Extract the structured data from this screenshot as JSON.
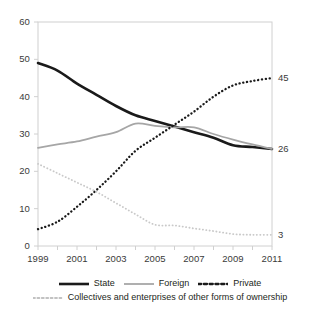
{
  "chart_data": {
    "type": "line",
    "title": "",
    "subtitle": "",
    "xlabel": "",
    "ylabel": "",
    "xlim": [
      1999,
      2011
    ],
    "ylim": [
      0,
      60
    ],
    "yticks": [
      0,
      10,
      20,
      30,
      40,
      50,
      60
    ],
    "xticks": [
      1999,
      2000,
      2001,
      2002,
      2003,
      2004,
      2005,
      2006,
      2007,
      2008,
      2009,
      2010,
      2011
    ],
    "xtick_labels": [
      "1999",
      "",
      "2001",
      "",
      "2003",
      "",
      "2005",
      "",
      "2007",
      "",
      "2009",
      "",
      "2011"
    ],
    "ytick_labels": [
      "0",
      "10",
      "20",
      "30",
      "40",
      "50",
      "60"
    ],
    "grid": false,
    "legend_position": "bottom",
    "x": [
      1999,
      2000,
      2001,
      2002,
      2003,
      2004,
      2005,
      2006,
      2007,
      2008,
      2009,
      2010,
      2011
    ],
    "series": [
      {
        "name": "State",
        "color": "#1a1a1a",
        "style": "solid",
        "width": 2.6,
        "values": [
          49,
          47,
          43.5,
          40.5,
          37.5,
          35,
          33.5,
          32,
          30.5,
          29,
          27,
          26.5,
          26
        ],
        "end_label": "26"
      },
      {
        "name": "Foreign",
        "color": "#a6a6a6",
        "style": "solid",
        "width": 1.8,
        "values": [
          26.3,
          27.2,
          28,
          29.3,
          30.5,
          32.8,
          32.2,
          31.8,
          31.8,
          30,
          28.5,
          27.2,
          26
        ],
        "end_label": ""
      },
      {
        "name": "Private",
        "color": "#1a1a1a",
        "style": "dashed",
        "width": 2.3,
        "values": [
          4.5,
          6.5,
          10.5,
          15,
          20,
          25.5,
          29,
          32.5,
          36,
          40,
          43,
          44.2,
          45
        ],
        "end_label": "45"
      },
      {
        "name": "Collectives and enterprises of other forms of ownership",
        "color": "#c9c9c9",
        "style": "dotted",
        "width": 1.8,
        "values": [
          22,
          19.5,
          17,
          14.5,
          11.5,
          8.5,
          5.7,
          5.5,
          4.7,
          4,
          3.2,
          3,
          3
        ],
        "end_label": "3"
      }
    ],
    "end_labels": [
      {
        "text": "45",
        "series": "Private",
        "value": 45
      },
      {
        "text": "26",
        "series": "State",
        "value": 26
      },
      {
        "text": "3",
        "series": "Collectives and enterprises of other forms of ownership",
        "value": 3
      }
    ],
    "legend": [
      {
        "label": "State",
        "style": "solid-thick-black"
      },
      {
        "label": "Foreign",
        "style": "solid-gray"
      },
      {
        "label": "Private",
        "style": "dashed-black"
      },
      {
        "label": "Collectives and enterprises of other forms of ownership",
        "style": "dotted-light-gray"
      }
    ],
    "frame_color": "#d0d0d0",
    "axis_text_color": "#3a3a3a"
  }
}
